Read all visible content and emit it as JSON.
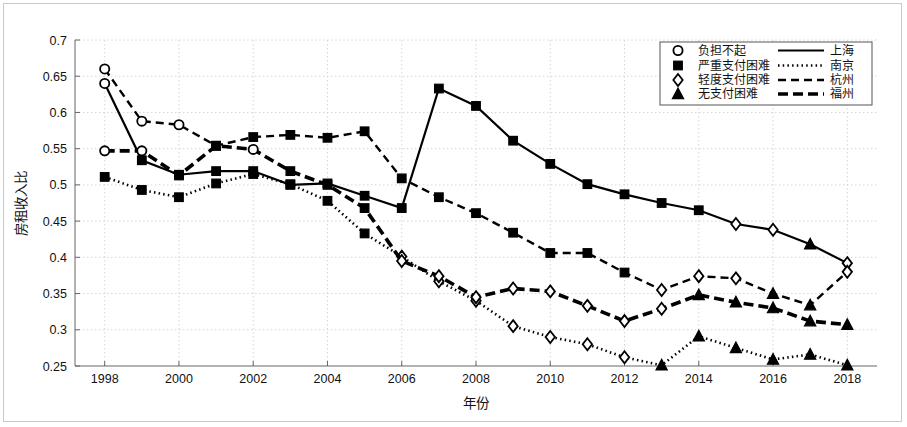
{
  "chart_data": {
    "type": "line",
    "title": "",
    "xlabel": "年份",
    "ylabel": "房租收入比",
    "xlim": [
      1997.2,
      2018.8
    ],
    "ylim": [
      0.25,
      0.7
    ],
    "xticks": [
      1998,
      2000,
      2002,
      2004,
      2006,
      2008,
      2010,
      2012,
      2014,
      2016,
      2018
    ],
    "xtick_labels": [
      "1998",
      "2000",
      "2002",
      "2004",
      "2006",
      "2008",
      "2010",
      "2012",
      "2014",
      "2016",
      "2018"
    ],
    "yticks": [
      0.25,
      0.3,
      0.35,
      0.4,
      0.45,
      0.5,
      0.55,
      0.6,
      0.65,
      0.7
    ],
    "ytick_labels": [
      "0.25",
      "0.3",
      "0.35",
      "0.4",
      "0.45",
      "0.5",
      "0.55",
      "0.6",
      "0.65",
      "0.7"
    ],
    "grid": true,
    "legend_position": "top-right",
    "x": [
      1998,
      1999,
      2000,
      2001,
      2002,
      2003,
      2004,
      2005,
      2006,
      2007,
      2008,
      2009,
      2010,
      2011,
      2012,
      2013,
      2014,
      2015,
      2016,
      2017,
      2018
    ],
    "series": [
      {
        "name": "上海",
        "line_style": "solid",
        "values": [
          0.64,
          0.534,
          0.514,
          0.519,
          0.519,
          0.5,
          0.502,
          0.485,
          0.468,
          0.633,
          0.609,
          0.561,
          0.529,
          0.501,
          0.487,
          0.475,
          0.465,
          0.446,
          0.438,
          0.418,
          0.392
        ],
        "markers": [
          "circle",
          "square",
          "square",
          "square",
          "square",
          "square",
          "square",
          "square",
          "square",
          "square",
          "square",
          "square",
          "square",
          "square",
          "square",
          "square",
          "square",
          "diamond",
          "diamond",
          "triangle",
          "diamond"
        ]
      },
      {
        "name": "南京",
        "line_style": "dotted",
        "values": [
          0.511,
          0.493,
          0.483,
          0.502,
          0.515,
          0.501,
          0.478,
          0.433,
          0.401,
          0.367,
          0.34,
          0.305,
          0.29,
          0.28,
          0.262,
          0.251,
          0.291,
          0.275,
          0.259,
          0.266,
          0.251
        ],
        "markers": [
          "square",
          "square",
          "square",
          "square",
          "square",
          "square",
          "square",
          "square",
          "diamond",
          "diamond",
          "diamond",
          "diamond",
          "diamond",
          "diamond",
          "diamond",
          "triangle",
          "triangle",
          "triangle",
          "triangle",
          "triangle",
          "triangle"
        ]
      },
      {
        "name": "杭州",
        "line_style": "dashed",
        "values": [
          0.66,
          0.588,
          0.583,
          0.554,
          0.566,
          0.569,
          0.565,
          0.574,
          0.509,
          0.483,
          0.461,
          0.434,
          0.406,
          0.406,
          0.379,
          0.355,
          0.374,
          0.371,
          0.35,
          0.334,
          0.38
        ],
        "markers": [
          "circle",
          "circle",
          "circle",
          "square",
          "square",
          "square",
          "square",
          "square",
          "square",
          "square",
          "square",
          "square",
          "square",
          "square",
          "square",
          "diamond",
          "diamond",
          "diamond",
          "triangle",
          "triangle",
          "diamond"
        ]
      },
      {
        "name": "福州",
        "line_style": "thick-dash",
        "values": [
          0.547,
          0.547,
          0.513,
          0.554,
          0.549,
          0.519,
          0.5,
          0.468,
          0.395,
          0.374,
          0.345,
          0.357,
          0.353,
          0.333,
          0.312,
          0.329,
          0.348,
          0.338,
          0.33,
          0.312,
          0.307
        ],
        "markers": [
          "circle",
          "circle",
          "square",
          "square",
          "circle",
          "square",
          "square",
          "square",
          "diamond",
          "diamond",
          "diamond",
          "diamond",
          "diamond",
          "diamond",
          "diamond",
          "diamond",
          "triangle",
          "triangle",
          "triangle",
          "triangle",
          "triangle"
        ]
      }
    ]
  },
  "legend": {
    "marker_entries": [
      {
        "marker": "circle",
        "label": "负担不起"
      },
      {
        "marker": "square",
        "label": "严重支付困难"
      },
      {
        "marker": "diamond",
        "label": "轻度支付困难"
      },
      {
        "marker": "triangle",
        "label": "无支付困难"
      }
    ],
    "line_entries": [
      {
        "style": "solid",
        "label": "上海"
      },
      {
        "style": "dotted",
        "label": "南京"
      },
      {
        "style": "dashed",
        "label": "杭州"
      },
      {
        "style": "thick-dash",
        "label": "福州"
      }
    ]
  },
  "colors": {
    "line": "#000000",
    "grid": "#cccccc",
    "axis": "#666666",
    "frame": "#c9c9c9",
    "background": "#ffffff"
  }
}
